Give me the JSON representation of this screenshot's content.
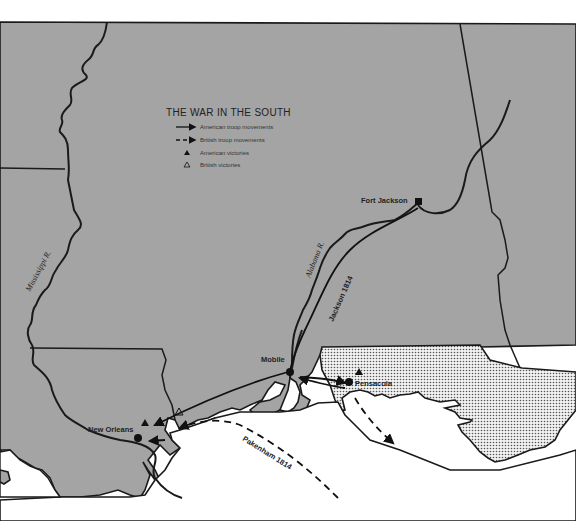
{
  "legend": {
    "title": "THE WAR IN THE SOUTH",
    "items": [
      {
        "symbol": "solid-arrow",
        "label": "American troop movements"
      },
      {
        "symbol": "dashed-arrow",
        "label": "British troop movements"
      },
      {
        "symbol": "filled-triangle",
        "label": "American victories"
      },
      {
        "symbol": "open-triangle",
        "label": "British victories"
      }
    ]
  },
  "places": {
    "fort_jackson": "Fort Jackson",
    "mobile": "Mobile",
    "pensacola": "Pensacola",
    "new_orleans": "New Orleans"
  },
  "rivers": {
    "mississippi": "Mississippi R.",
    "alabama": "Alabama R."
  },
  "routes": {
    "jackson": "Jackson 1814",
    "pakenham": "Pakenham 1814"
  },
  "colors": {
    "land": "#a4a4a4",
    "water": "#ffffff",
    "lines": "#1a1a1a",
    "spanish_florida": "stippled"
  }
}
